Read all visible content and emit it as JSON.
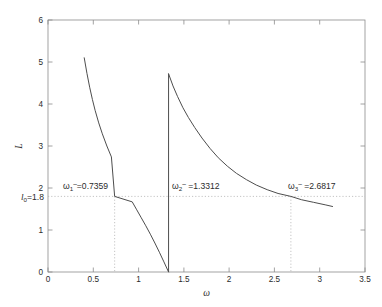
{
  "chart_data": {
    "type": "line",
    "title": "",
    "xlabel": "ω",
    "ylabel": "L",
    "xlim": [
      0,
      3.5
    ],
    "ylim": [
      0,
      6
    ],
    "xticks": [
      "0",
      "0.5",
      "1",
      "1.5",
      "2",
      "2.5",
      "3",
      "3.5"
    ],
    "xtick_values": [
      0,
      0.5,
      1,
      1.5,
      2,
      2.5,
      3,
      3.5
    ],
    "yticks": [
      "0",
      "1",
      "2",
      "3",
      "4",
      "5",
      "6"
    ],
    "ytick_values": [
      0,
      1,
      2,
      3,
      4,
      5,
      6
    ],
    "grid": false,
    "legend": null,
    "series": [
      {
        "name": "branch-1",
        "x": [
          0.4,
          0.43,
          0.46,
          0.49,
          0.52,
          0.56,
          0.6,
          0.65,
          0.7,
          0.7359,
          0.78,
          0.83,
          0.88,
          0.93,
          0.98,
          1.03,
          1.08,
          1.13,
          1.18,
          1.23,
          1.28,
          1.3312
        ],
        "y": [
          5.1,
          4.73,
          4.4,
          4.11,
          3.85,
          3.55,
          3.29,
          3.0,
          2.74,
          1.8,
          2.31,
          2.08,
          1.87,
          1.67,
          1.48,
          1.29,
          1.1,
          0.9,
          0.69,
          0.47,
          0.24,
          0.0
        ]
      },
      {
        "name": "branch-2",
        "x": [
          1.3312,
          1.38,
          1.43,
          1.49,
          1.55,
          1.62,
          1.7,
          1.79,
          1.88,
          1.98,
          2.08,
          2.19,
          2.3,
          2.42,
          2.54,
          2.6817,
          2.8,
          2.93,
          3.06,
          3.1416
        ],
        "y": [
          4.72,
          4.43,
          4.18,
          3.91,
          3.68,
          3.44,
          3.19,
          2.94,
          2.72,
          2.52,
          2.35,
          2.2,
          2.07,
          1.96,
          1.87,
          1.8,
          1.72,
          1.66,
          1.6,
          1.56
        ]
      }
    ],
    "discontinuity": {
      "x": 1.3312,
      "y_from": 0.0,
      "y_to": 4.72
    },
    "threshold": {
      "label": "l_0=1.8",
      "value": 1.8
    },
    "annotations": [
      {
        "name": "omega-1",
        "symbol": "ω",
        "subscript": "1",
        "superscript": "–",
        "equals": "=0.7359",
        "value": 0.7359,
        "text": "ω₁⁻=0.7359"
      },
      {
        "name": "omega-2",
        "symbol": "ω",
        "subscript": "2",
        "superscript": "–",
        "equals": "=1.3312",
        "value": 1.3312,
        "text": "ω₂⁻ =1.3312"
      },
      {
        "name": "omega-3",
        "symbol": "ω",
        "subscript": "3",
        "superscript": "–",
        "equals": "=2.6817",
        "value": 2.6817,
        "text": "ω₃⁻ =2.6817"
      }
    ]
  },
  "axes": {
    "x_label": "ω",
    "y_label": "L",
    "x_tick_labels": [
      "0",
      "0.5",
      "1",
      "1.5",
      "2",
      "2.5",
      "3",
      "3.5"
    ],
    "y_tick_labels": [
      "0",
      "1",
      "2",
      "3",
      "4",
      "5",
      "6"
    ]
  },
  "threshold_label": {
    "prefix": "l",
    "subscript": "0",
    "suffix": "=1.8"
  },
  "annotation_labels": {
    "omega1": {
      "symbol": "ω",
      "sub": "1",
      "sup": "–",
      "rest": "=0.7359"
    },
    "omega2": {
      "symbol": "ω",
      "sub": "2",
      "sup": "–",
      "rest": " =1.3312"
    },
    "omega3": {
      "symbol": "ω",
      "sub": "3",
      "sup": "–",
      "rest": " =2.6817"
    }
  },
  "colors": {
    "curve": "#4d4d4d",
    "axis": "#8c8c8c",
    "dotted": "#b5b5b5",
    "text": "#2b2b2b",
    "background": "#ffffff"
  }
}
